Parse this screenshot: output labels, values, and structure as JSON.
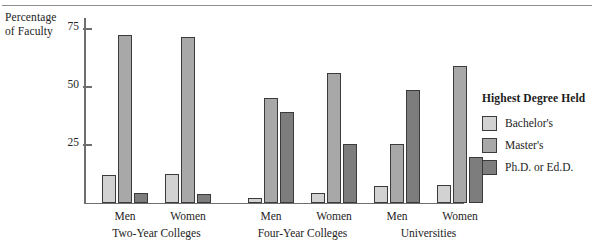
{
  "chart_data": {
    "type": "bar",
    "title": "",
    "ylabel": "Percentage of Faculty",
    "xlabel": "",
    "ylim": [
      0,
      80
    ],
    "yticks": [
      25,
      50,
      75
    ],
    "grid": false,
    "legend_position": "right",
    "legend_title": "Highest Degree Held",
    "categories": [
      "Men",
      "Women",
      "Men",
      "Women",
      "Men",
      "Women"
    ],
    "groups": [
      {
        "name": "Two-Year Colleges",
        "subgroups": [
          "Men",
          "Women"
        ]
      },
      {
        "name": "Four-Year Colleges",
        "subgroups": [
          "Men",
          "Women"
        ]
      },
      {
        "name": "Universities",
        "subgroups": [
          "Men",
          "Women"
        ]
      }
    ],
    "series": [
      {
        "name": "Bachelor's",
        "color": "#d2d2d2",
        "values": [
          12,
          12.5,
          2,
          4,
          7,
          7.5
        ]
      },
      {
        "name": "Master's",
        "color": "#a8a8a8",
        "values": [
          72,
          71.5,
          45,
          56,
          25,
          59
        ]
      },
      {
        "name": "Ph.D. or Ed.D.",
        "color": "#7d7d7d",
        "values": [
          4,
          3.5,
          39,
          25,
          48.5,
          19.5
        ]
      }
    ]
  },
  "axis": {
    "y_title_line1": "Percentage",
    "y_title_line2": "of Faculty",
    "ticks": [
      {
        "label": "75",
        "value": 75
      },
      {
        "label": "50",
        "value": 50
      },
      {
        "label": "25",
        "value": 25
      }
    ]
  },
  "groups": [
    {
      "label": "Two-Year Colleges",
      "subgroups": [
        {
          "label": "Men",
          "bars": [
            12,
            72,
            4
          ]
        },
        {
          "label": "Women",
          "bars": [
            12.5,
            71.5,
            3.5
          ]
        }
      ]
    },
    {
      "label": "Four-Year Colleges",
      "subgroups": [
        {
          "label": "Men",
          "bars": [
            2,
            45,
            39
          ]
        },
        {
          "label": "Women",
          "bars": [
            4,
            56,
            25
          ]
        }
      ]
    },
    {
      "label": "Universities",
      "subgroups": [
        {
          "label": "Men",
          "bars": [
            7,
            25,
            48.5
          ]
        },
        {
          "label": "Women",
          "bars": [
            7.5,
            59,
            19.5
          ]
        }
      ]
    }
  ],
  "legend": {
    "title": "Highest Degree Held",
    "items": [
      {
        "label": "Bachelor's",
        "color": "#d2d2d2"
      },
      {
        "label": "Master's",
        "color": "#a8a8a8"
      },
      {
        "label": "Ph.D. or Ed.D.",
        "color": "#7d7d7d"
      }
    ]
  }
}
